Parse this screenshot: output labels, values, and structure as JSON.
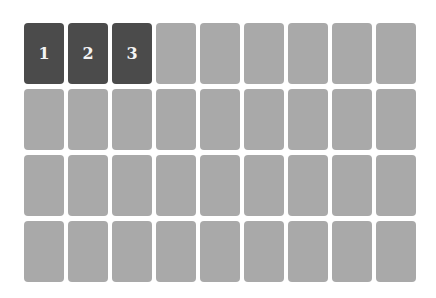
{
  "board": {
    "columns": 9,
    "rows": 4,
    "colors": {
      "revealed": "#4b4b4b",
      "hidden": "#a9a9a9",
      "label": "#f4f4f4"
    },
    "cards": [
      {
        "label": "1",
        "state": "revealed"
      },
      {
        "label": "2",
        "state": "revealed"
      },
      {
        "label": "3",
        "state": "revealed"
      },
      {
        "label": "",
        "state": "hidden"
      },
      {
        "label": "",
        "state": "hidden"
      },
      {
        "label": "",
        "state": "hidden"
      },
      {
        "label": "",
        "state": "hidden"
      },
      {
        "label": "",
        "state": "hidden"
      },
      {
        "label": "",
        "state": "hidden"
      },
      {
        "label": "",
        "state": "hidden"
      },
      {
        "label": "",
        "state": "hidden"
      },
      {
        "label": "",
        "state": "hidden"
      },
      {
        "label": "",
        "state": "hidden"
      },
      {
        "label": "",
        "state": "hidden"
      },
      {
        "label": "",
        "state": "hidden"
      },
      {
        "label": "",
        "state": "hidden"
      },
      {
        "label": "",
        "state": "hidden"
      },
      {
        "label": "",
        "state": "hidden"
      },
      {
        "label": "",
        "state": "hidden"
      },
      {
        "label": "",
        "state": "hidden"
      },
      {
        "label": "",
        "state": "hidden"
      },
      {
        "label": "",
        "state": "hidden"
      },
      {
        "label": "",
        "state": "hidden"
      },
      {
        "label": "",
        "state": "hidden"
      },
      {
        "label": "",
        "state": "hidden"
      },
      {
        "label": "",
        "state": "hidden"
      },
      {
        "label": "",
        "state": "hidden"
      },
      {
        "label": "",
        "state": "hidden"
      },
      {
        "label": "",
        "state": "hidden"
      },
      {
        "label": "",
        "state": "hidden"
      },
      {
        "label": "",
        "state": "hidden"
      },
      {
        "label": "",
        "state": "hidden"
      },
      {
        "label": "",
        "state": "hidden"
      },
      {
        "label": "",
        "state": "hidden"
      },
      {
        "label": "",
        "state": "hidden"
      },
      {
        "label": "",
        "state": "hidden"
      }
    ]
  }
}
